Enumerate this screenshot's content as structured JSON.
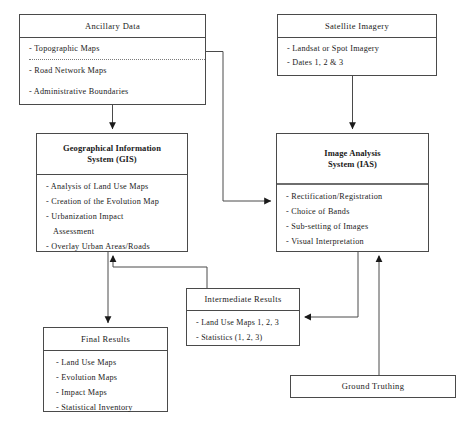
{
  "diagram": {
    "line_color": "#4a4a4a",
    "text_color": "#1a1a1a",
    "background": "#ffffff"
  },
  "boxes": {
    "ancillary": {
      "title": "Ancillary Data",
      "items": [
        "- Topographic Maps",
        "- Road Network Maps",
        "- Administrative Boundaries"
      ]
    },
    "satellite": {
      "title": "Satellite Imagery",
      "items": [
        "- Landsat or Spot Imagery",
        "- Dates 1, 2 & 3"
      ]
    },
    "gis": {
      "title_line1": "Geographical Information",
      "title_line2": "System (GIS)",
      "items": [
        "- Analysis of Land Use Maps",
        "- Creation of the Evolution Map",
        "- Urbanization Impact",
        "Assessment",
        "- Overlay Urban Areas/Roads"
      ]
    },
    "ias": {
      "title_line1": "Image Analysis",
      "title_line2": "System (IAS)",
      "items": [
        "- Rectification/Registration",
        "- Choice of Bands",
        "- Sub-setting of Images",
        "- Visual Interpretation"
      ]
    },
    "intermediate": {
      "title": "Intermediate Results",
      "items": [
        "- Land Use Maps 1, 2, 3",
        "- Statistics (1, 2, 3)"
      ]
    },
    "final": {
      "title": "Final Results",
      "items": [
        "- Land Use Maps",
        "- Evolution Maps",
        "- Impact Maps",
        "- Statistical Inventory"
      ]
    },
    "ground": {
      "title": "Ground Truthing"
    }
  },
  "connectors": [
    {
      "name": "ancillary-to-gis",
      "from": "ancillary",
      "to": "gis",
      "arrow": "down"
    },
    {
      "name": "ancillary-to-ias",
      "from": "ancillary",
      "to": "ias",
      "arrow": "right"
    },
    {
      "name": "satellite-to-ias",
      "from": "satellite",
      "to": "ias",
      "arrow": "down"
    },
    {
      "name": "gis-to-final",
      "from": "gis",
      "to": "final",
      "arrow": "down"
    },
    {
      "name": "intermediate-to-gis",
      "from": "intermediate",
      "to": "gis",
      "arrow": "up"
    },
    {
      "name": "ias-to-intermediate",
      "from": "ias",
      "to": "intermediate",
      "arrow": "left"
    },
    {
      "name": "ground-to-ias",
      "from": "ground",
      "to": "ias",
      "arrow": "up"
    }
  ]
}
